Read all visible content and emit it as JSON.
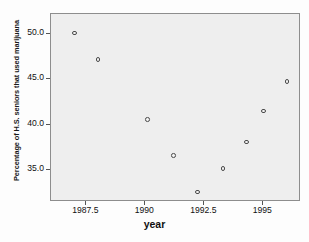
{
  "chart_data": {
    "type": "scatter",
    "title": "",
    "xlabel": "year",
    "ylabel": "Percentage of H.S. seniors that used marijuana",
    "xlim": [
      1986.0,
      1996.6
    ],
    "ylim": [
      31.5,
      52.2
    ],
    "grid": false,
    "legend": null,
    "marker": "open-circle",
    "xticks": [
      {
        "value": 1987.5,
        "label": "1987.5"
      },
      {
        "value": 1990.0,
        "label": "1990"
      },
      {
        "value": 1992.5,
        "label": "1992.5"
      },
      {
        "value": 1995.0,
        "label": "1995"
      }
    ],
    "yticks": [
      {
        "value": 50.0,
        "label": "50.0"
      },
      {
        "value": 45.0,
        "label": "45.0"
      },
      {
        "value": 40.0,
        "label": "40.0"
      },
      {
        "value": 35.0,
        "label": "35.0"
      }
    ],
    "x": [
      1987.0,
      1988.0,
      1990.1,
      1991.2,
      1992.2,
      1993.3,
      1994.3,
      1995.0,
      1996.0
    ],
    "y": [
      50.1,
      47.2,
      40.6,
      36.6,
      32.6,
      35.2,
      38.1,
      41.5,
      44.8
    ],
    "points": [
      {
        "x": 1987.0,
        "y": 50.1
      },
      {
        "x": 1988.0,
        "y": 47.2
      },
      {
        "x": 1990.1,
        "y": 40.6
      },
      {
        "x": 1991.2,
        "y": 36.6
      },
      {
        "x": 1992.2,
        "y": 32.6
      },
      {
        "x": 1993.3,
        "y": 35.2
      },
      {
        "x": 1994.3,
        "y": 38.1
      },
      {
        "x": 1995.0,
        "y": 41.5
      },
      {
        "x": 1996.0,
        "y": 44.8
      }
    ],
    "colors": {
      "plot_background": "#eeeeee",
      "figure_background": "#fdfdfd",
      "frame": "#8d8d8d",
      "marker_edge": "#4a4a4a",
      "text": "#111111"
    }
  }
}
